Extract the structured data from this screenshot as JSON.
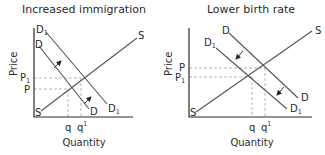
{
  "panels": [
    {
      "title": "Increased immigration",
      "ylabel": "Price",
      "xlabel": "Quantity",
      "curves": {
        "demand_original": {
          "label": "D",
          "sub": ""
        },
        "demand_new": {
          "label": "D",
          "sub": "1"
        },
        "supply": {
          "label": "S"
        }
      },
      "price_labels": {
        "upper": {
          "label": "P",
          "sub": "1"
        },
        "lower": {
          "label": "P",
          "sub": ""
        }
      },
      "quantity_labels": {
        "left": {
          "label": "q",
          "sup": ""
        },
        "right": {
          "label": "q",
          "sup": "1"
        }
      },
      "shift_direction": "right"
    },
    {
      "title": "Lower birth rate",
      "ylabel": "Price",
      "xlabel": "Quantity",
      "curves": {
        "demand_original": {
          "label": "D",
          "sub": ""
        },
        "demand_new": {
          "label": "D",
          "sub": "1"
        },
        "supply": {
          "label": "S"
        }
      },
      "price_labels": {
        "upper": {
          "label": "P",
          "sub": ""
        },
        "lower": {
          "label": "P",
          "sub": "1"
        }
      },
      "quantity_labels": {
        "left": {
          "label": "q",
          "sup": ""
        },
        "right": {
          "label": "q",
          "sup": "1"
        }
      },
      "shift_direction": "left"
    }
  ],
  "colors": {
    "text": "#2a2a2a",
    "curve": "#555555",
    "dash": "#9a9a9a"
  }
}
